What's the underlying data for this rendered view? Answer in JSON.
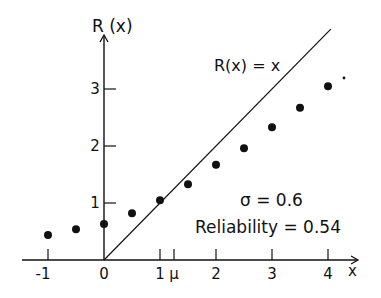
{
  "chart_data": {
    "type": "scatter",
    "title": "",
    "xlabel": "x",
    "ylabel": "R(x)",
    "x_ticks": [
      {
        "value": -1,
        "label": "-1"
      },
      {
        "value": 0,
        "label": "0"
      },
      {
        "value": 1,
        "label": "1"
      },
      {
        "value": 1.25,
        "label": "μ"
      },
      {
        "value": 2,
        "label": "2"
      },
      {
        "value": 3,
        "label": "3"
      },
      {
        "value": 4,
        "label": "4"
      }
    ],
    "y_ticks": [
      {
        "value": 1,
        "label": "1"
      },
      {
        "value": 2,
        "label": "2"
      },
      {
        "value": 3,
        "label": "3"
      }
    ],
    "xlim": [
      -1.4,
      4.5
    ],
    "ylim": [
      0,
      4.1
    ],
    "grid": false,
    "series": [
      {
        "name": "R(x) = x",
        "kind": "line",
        "x": [
          0,
          4.05
        ],
        "y": [
          0,
          4.05
        ]
      },
      {
        "name": "regression points",
        "kind": "scatter",
        "x": [
          -1,
          -0.5,
          0,
          0.5,
          1,
          1.5,
          2,
          2.5,
          3,
          3.5,
          4
        ],
        "y": [
          0.44,
          0.54,
          0.63,
          0.82,
          1.05,
          1.33,
          1.67,
          1.96,
          2.33,
          2.67,
          3.05
        ]
      }
    ],
    "annotations": [
      {
        "text": "R(x) = x",
        "x": 2.0,
        "y": 3.75
      },
      {
        "text": "σ = 0.6",
        "x": 2.55,
        "y": 1.05
      },
      {
        "text": "Reliability = 0.54",
        "x": 2.2,
        "y": 0.6
      }
    ]
  },
  "labels": {
    "y_axis": "R (x)",
    "x_axis": "x",
    "line_label": "R(x) = x",
    "sigma": "σ = 0.6",
    "reliability": "Reliability = 0.54"
  }
}
